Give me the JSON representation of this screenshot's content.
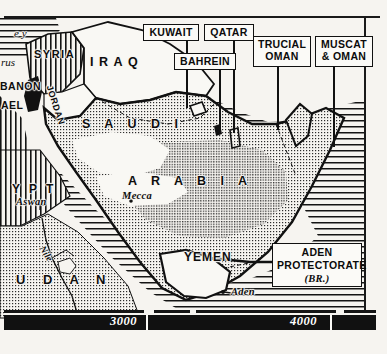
{
  "map": {
    "title": "Arabian Peninsula",
    "style": "engraved black-and-white reference map",
    "colors": {
      "ink": "#111111",
      "paper": "#f6f4f0",
      "sea_hatch": "#1a1a1a",
      "desert_stipple": "#2b2b2b"
    },
    "countries": [
      {
        "name": "SYRIA",
        "x": 36,
        "y": 54,
        "fill": "vertical-hatch"
      },
      {
        "name": "IRAQ",
        "x": 93,
        "y": 62,
        "fill": "plain"
      },
      {
        "name": "JORDAN",
        "x": 56,
        "y": 92,
        "fill": "plain"
      },
      {
        "name": "YEMEN",
        "x": 186,
        "y": 257,
        "fill": "plain"
      }
    ],
    "country_large": [
      {
        "name": "S A U D I",
        "x": 82,
        "y": 123
      },
      {
        "name": "A R A B I A",
        "x": 130,
        "y": 180
      }
    ],
    "clipped_labels": [
      {
        "text": "e y",
        "x": 14,
        "y": 34,
        "note": "Turkey"
      },
      {
        "text": "rus",
        "x": 2,
        "y": 62,
        "note": "Cyprus"
      },
      {
        "text": "BANON",
        "x": 1,
        "y": 86,
        "note": "Lebanon"
      },
      {
        "text": "AEL",
        "x": 2,
        "y": 104,
        "note": "Israel"
      },
      {
        "text": "YPT",
        "x": 10,
        "y": 188,
        "note": "Egypt"
      },
      {
        "text": "U  D  A  N",
        "x": 16,
        "y": 281,
        "note": "Sudan"
      }
    ],
    "cities": [
      {
        "name": "Mecca",
        "x": 125,
        "y": 196
      },
      {
        "name": "Aden",
        "x": 230,
        "y": 296
      },
      {
        "name": "Aswan",
        "x": 20,
        "y": 203
      }
    ],
    "rivers": [
      {
        "name": "Nile",
        "x": 48,
        "y": 253
      }
    ],
    "callouts": [
      {
        "id": "kuwait",
        "lines": [
          "KUWAIT"
        ],
        "x": 143,
        "y": 24,
        "w": 56,
        "h": 17,
        "leader_x": 186,
        "leader_top": 41,
        "leader_h": 67
      },
      {
        "id": "qatar",
        "lines": [
          "QATAR"
        ],
        "x": 204,
        "y": 24,
        "w": 50,
        "h": 17,
        "leader_x": 233,
        "leader_top": 41,
        "leader_h": 92
      },
      {
        "id": "bahrein",
        "lines": [
          "BAHREIN"
        ],
        "x": 174,
        "y": 53,
        "w": 60,
        "h": 17,
        "leader_x": 219,
        "leader_top": 70,
        "leader_h": 60
      },
      {
        "id": "trucial",
        "lines": [
          "TRUCIAL",
          "OMAN"
        ],
        "x": 253,
        "y": 36,
        "w": 58,
        "h": 30,
        "leader_x": 277,
        "leader_top": 66,
        "leader_h": 64
      },
      {
        "id": "muscat",
        "lines": [
          "MUSCAT",
          "& OMAN"
        ],
        "x": 315,
        "y": 36,
        "w": 58,
        "h": 30,
        "leader_x": 333,
        "leader_top": 66,
        "leader_h": 81
      },
      {
        "id": "aden_prot",
        "lines": [
          "ADEN",
          "PROTECTORATE",
          "(BR.)"
        ],
        "x": 272,
        "y": 243,
        "w": 88,
        "h": 42,
        "leader_x": 0,
        "leader_top": 0,
        "leader_h": 0
      }
    ],
    "scale": {
      "marks": [
        {
          "label": "3000",
          "x": 110
        },
        {
          "label": "4000",
          "x": 290
        }
      ],
      "dividers": [
        146,
        330
      ]
    }
  }
}
